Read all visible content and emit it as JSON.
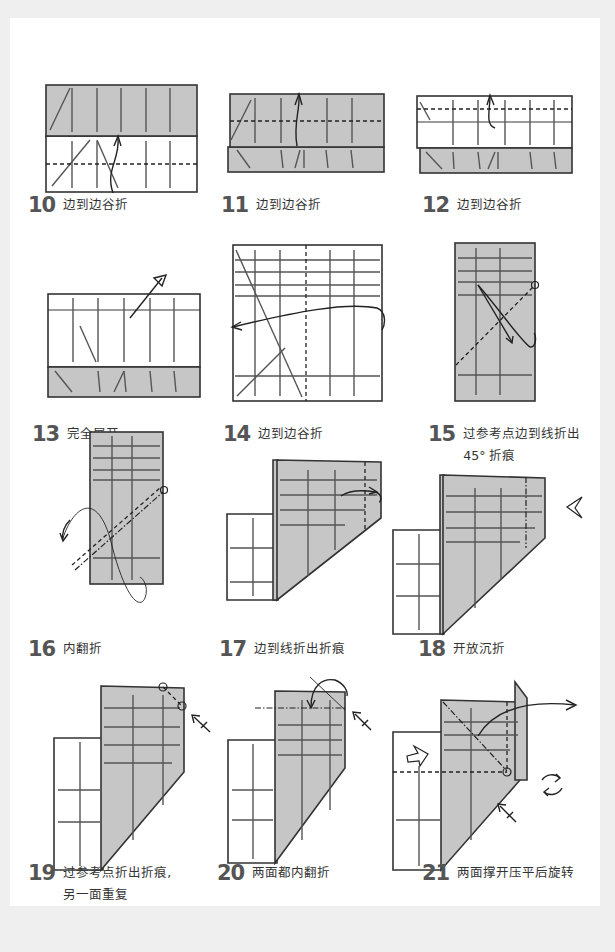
{
  "page": {
    "background": "#efefef",
    "card_color": "#ffffff",
    "paper_color": "#c6c6c6"
  },
  "steps": [
    {
      "number": "10",
      "text": "边到边谷折",
      "icon": "valley-fold-arrow"
    },
    {
      "number": "11",
      "text": "边到边谷折",
      "icon": "valley-fold-arrow"
    },
    {
      "number": "12",
      "text": "边到边谷折",
      "icon": "valley-fold-arrow"
    },
    {
      "number": "13",
      "text": "完全展开",
      "icon": "unfold-arrow"
    },
    {
      "number": "14",
      "text": "边到边谷折",
      "icon": "valley-fold-arrow"
    },
    {
      "number": "15",
      "text": "过参考点边到线折出",
      "text2": "45° 折痕",
      "icon": "fold-and-unfold-arrow"
    },
    {
      "number": "16",
      "text": "内翻折",
      "icon": "inside-reverse-fold-arrow"
    },
    {
      "number": "17",
      "text": "边到线折出折痕",
      "icon": "fold-and-unfold-arrow"
    },
    {
      "number": "18",
      "text": "开放沉折",
      "icon": "sink-arrow"
    },
    {
      "number": "19",
      "text": "过参考点折出折痕,",
      "text2": "另一面重复",
      "icon": "repeat-behind-arrow"
    },
    {
      "number": "20",
      "text": "两面都内翻折",
      "icon": "inside-reverse-fold-arrow"
    },
    {
      "number": "21",
      "text": "两面撑开压平后旋转",
      "icon": "squash-and-rotate-arrow"
    }
  ]
}
